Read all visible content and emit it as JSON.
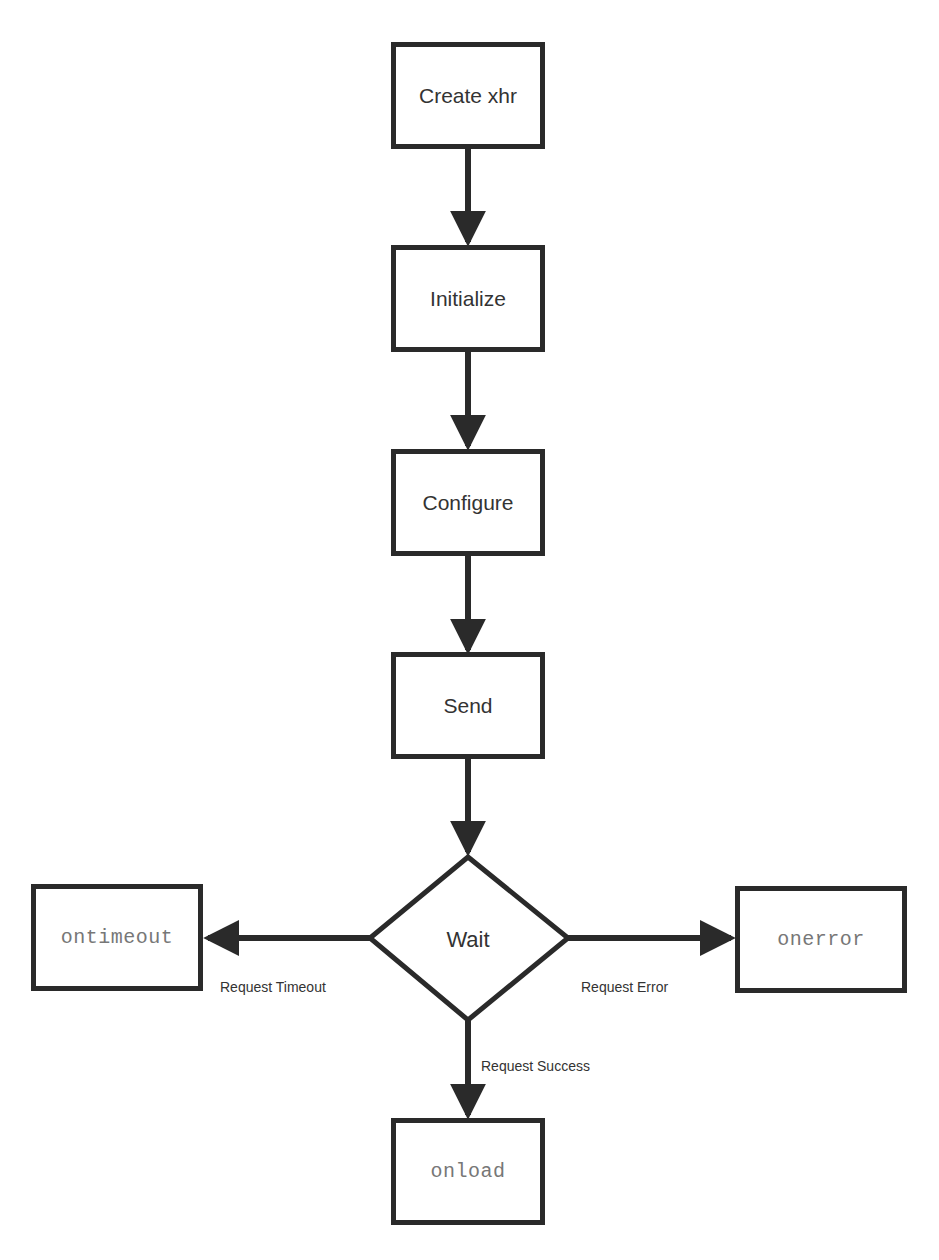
{
  "diagram": {
    "type": "flowchart",
    "nodes": {
      "create": {
        "label": "Create xhr",
        "shape": "rectangle"
      },
      "initialize": {
        "label": "Initialize",
        "shape": "rectangle"
      },
      "configure": {
        "label": "Configure",
        "shape": "rectangle"
      },
      "send": {
        "label": "Send",
        "shape": "rectangle"
      },
      "wait": {
        "label": "Wait",
        "shape": "diamond"
      },
      "ontimeout": {
        "label": "ontimeout",
        "shape": "rectangle",
        "font": "monospace"
      },
      "onerror": {
        "label": "onerror",
        "shape": "rectangle",
        "font": "monospace"
      },
      "onload": {
        "label": "onload",
        "shape": "rectangle",
        "font": "monospace"
      }
    },
    "edges": {
      "create_to_initialize": {
        "from": "Create xhr",
        "to": "Initialize",
        "label": ""
      },
      "initialize_to_configure": {
        "from": "Initialize",
        "to": "Configure",
        "label": ""
      },
      "configure_to_send": {
        "from": "Configure",
        "to": "Send",
        "label": ""
      },
      "send_to_wait": {
        "from": "Send",
        "to": "Wait",
        "label": ""
      },
      "wait_to_ontimeout": {
        "from": "Wait",
        "to": "ontimeout",
        "label": "Request Timeout"
      },
      "wait_to_onerror": {
        "from": "Wait",
        "to": "onerror",
        "label": "Request Error"
      },
      "wait_to_onload": {
        "from": "Wait",
        "to": "onload",
        "label": "Request Success"
      }
    },
    "colors": {
      "stroke": "#2a2a2a",
      "text": "#333333",
      "code_text": "#777777",
      "background": "#ffffff"
    }
  }
}
